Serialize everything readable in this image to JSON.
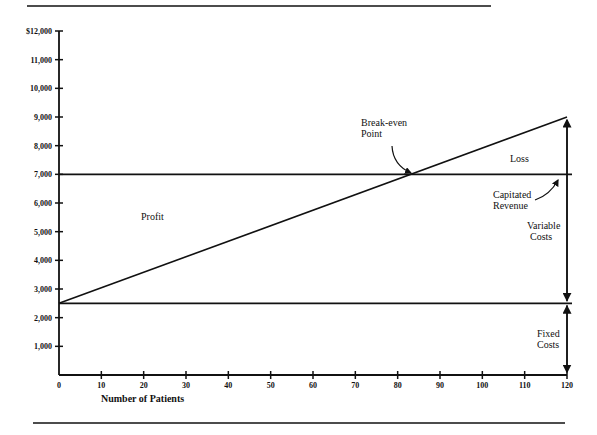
{
  "chart_data": {
    "type": "line",
    "title": "",
    "xlabel": "Number of Patients",
    "ylabel": "",
    "xlim": [
      0,
      120
    ],
    "ylim": [
      0,
      12000
    ],
    "x_ticks": [
      "0",
      "10",
      "20",
      "30",
      "40",
      "50",
      "60",
      "70",
      "80",
      "90",
      "100",
      "110",
      "120"
    ],
    "y_ticks": [
      "1,000",
      "2,000",
      "3,000",
      "4,000",
      "5,000",
      "6,000",
      "7,000",
      "8,000",
      "9,000",
      "10,000",
      "11,000",
      "$12,000"
    ],
    "grid": false,
    "series": [
      {
        "name": "Total Costs",
        "x": [
          0,
          120
        ],
        "values": [
          2500,
          9000
        ]
      },
      {
        "name": "Capitated Revenue",
        "x": [
          0,
          120
        ],
        "values": [
          7000,
          7000
        ]
      },
      {
        "name": "Fixed Costs",
        "x": [
          0,
          120
        ],
        "values": [
          2500,
          2500
        ]
      }
    ],
    "annotations": [
      {
        "text": "Break-even Point",
        "x": 83,
        "y": 7000
      },
      {
        "text": "Loss",
        "region": "above revenue, right of break-even"
      },
      {
        "text": "Profit",
        "region": "below revenue, left of break-even"
      },
      {
        "text": "Capitated Revenue",
        "x": 120,
        "y": 7000
      },
      {
        "text": "Variable Costs",
        "x": 120,
        "range": [
          2500,
          9000
        ]
      },
      {
        "text": "Fixed Costs",
        "x": 120,
        "range": [
          0,
          2500
        ]
      }
    ]
  },
  "labels": {
    "xlabel": "Number of Patients",
    "break_even_1": "Break-even",
    "break_even_2": "Point",
    "loss": "Loss",
    "profit": "Profit",
    "capitated_1": "Capitated",
    "capitated_2": "Revenue",
    "variable_1": "Variable",
    "variable_2": "Costs",
    "fixed_1": "Fixed",
    "fixed_2": "Costs"
  }
}
